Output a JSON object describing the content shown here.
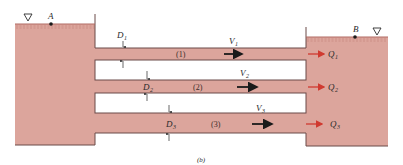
{
  "figure": {
    "caption": "(b)",
    "colors": {
      "water": "#dca59c",
      "outline": "#6a4a48",
      "flow_arrow": "#d03a30",
      "velocity_arrow": "#1a1a1a",
      "background": "#ffffff"
    },
    "reservoirs": [
      {
        "id": "left",
        "point_label": "A",
        "surface_symbol": "▽"
      },
      {
        "id": "right",
        "point_label": "B",
        "surface_symbol": "▽"
      }
    ],
    "pipes": [
      {
        "id": "1",
        "number_label": "(1)",
        "diameter_label": "D",
        "diameter_sub": "1",
        "velocity_label": "V",
        "velocity_sub": "1",
        "flow_label": "Q",
        "flow_sub": "1"
      },
      {
        "id": "2",
        "number_label": "(2)",
        "diameter_label": "D",
        "diameter_sub": "2",
        "velocity_label": "V",
        "velocity_sub": "2",
        "flow_label": "Q",
        "flow_sub": "2"
      },
      {
        "id": "3",
        "number_label": "(3)",
        "diameter_label": "D",
        "diameter_sub": "3",
        "velocity_label": "V",
        "velocity_sub": "3",
        "flow_label": "Q",
        "flow_sub": "3"
      }
    ]
  }
}
